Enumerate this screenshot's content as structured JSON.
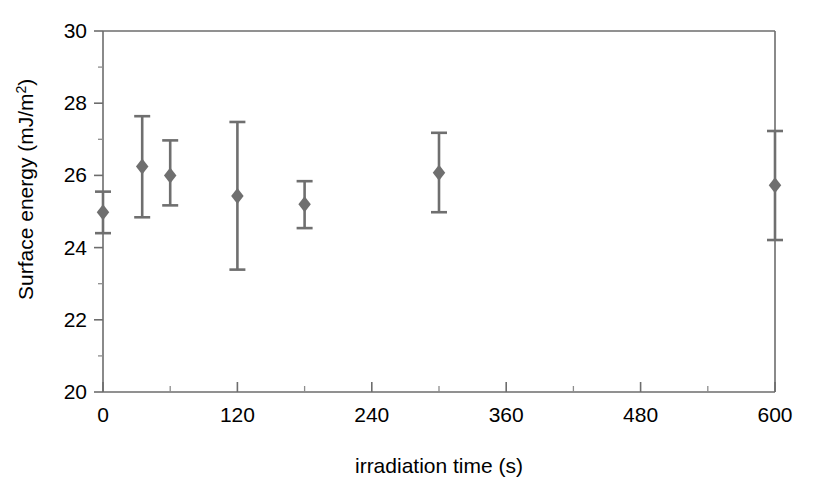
{
  "chart_data": {
    "type": "scatter",
    "title": "",
    "subtitle": "",
    "xlabel": "irradiation time   (s)",
    "ylabel": "Surface energy   (mJ/m",
    "ylabel_superscript": "2",
    "ylabel_suffix": ")",
    "xlim": [
      0,
      600
    ],
    "ylim": [
      20,
      30
    ],
    "x_ticks": [
      0,
      120,
      240,
      360,
      480,
      600
    ],
    "x_tick_labels": [
      "0",
      "120",
      "240",
      "360",
      "480",
      "600"
    ],
    "x_minor_ticks": [
      60,
      180,
      300,
      420,
      540
    ],
    "y_ticks": [
      20,
      22,
      24,
      26,
      28,
      30
    ],
    "y_tick_labels": [
      "20",
      "22",
      "24",
      "26",
      "28",
      "30"
    ],
    "y_minor_ticks": [
      21,
      23,
      25,
      27,
      29
    ],
    "grid": false,
    "legend": "none",
    "marker_shape": "diamond",
    "marker_color": "#6f6f6f",
    "error_bar_color": "#6f6f6f",
    "frame_color": "#6d6d6d",
    "series": [
      {
        "name": "surface energy",
        "points": [
          {
            "x": 0,
            "y": 24.98,
            "err_up": 0.57,
            "err_down": 0.58
          },
          {
            "x": 35,
            "y": 26.25,
            "err_up": 1.39,
            "err_down": 1.41
          },
          {
            "x": 60,
            "y": 26.0,
            "err_up": 0.97,
            "err_down": 0.83
          },
          {
            "x": 120,
            "y": 25.43,
            "err_up": 2.05,
            "err_down": 2.04
          },
          {
            "x": 180,
            "y": 25.2,
            "err_up": 0.64,
            "err_down": 0.66
          },
          {
            "x": 300,
            "y": 26.07,
            "err_up": 1.11,
            "err_down": 1.09
          },
          {
            "x": 600,
            "y": 25.73,
            "err_up": 1.5,
            "err_down": 1.52
          }
        ]
      }
    ]
  }
}
